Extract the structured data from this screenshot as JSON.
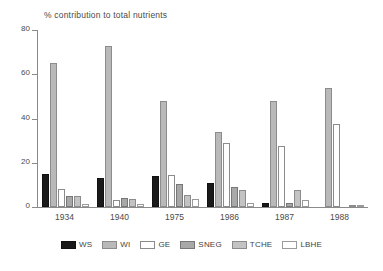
{
  "chart_data": {
    "type": "bar",
    "title": "% contribution to total nutrients",
    "xlabel": "",
    "ylabel": "",
    "ylim": [
      0,
      80
    ],
    "yticks": [
      0,
      20,
      40,
      60,
      80
    ],
    "grid": false,
    "legend_position": "bottom",
    "categories": [
      "1934",
      "1940",
      "1975",
      "1986",
      "1987",
      "1988"
    ],
    "series": [
      {
        "name": "WS",
        "key": "ws",
        "color": "#1a1a1a",
        "values": [
          15,
          13,
          14,
          11,
          2,
          0
        ]
      },
      {
        "name": "WI",
        "key": "wi",
        "color": "#b9b9b9",
        "values": [
          65,
          73,
          48,
          34,
          48,
          54
        ]
      },
      {
        "name": "GE",
        "key": "ge",
        "color": "#ffffff",
        "values": [
          8,
          3,
          14.5,
          29,
          27.5,
          37.5
        ]
      },
      {
        "name": "SNEG",
        "key": "sneg",
        "color": "#a8a8a8",
        "values": [
          5,
          4,
          10.5,
          9,
          2,
          0
        ]
      },
      {
        "name": "TCHE",
        "key": "tche",
        "color": "#c3c3c3",
        "values": [
          5,
          3.5,
          5.5,
          7.5,
          7.5,
          1
        ]
      },
      {
        "name": "LBHE",
        "key": "lbhe",
        "color": "#ffffff",
        "values": [
          1.5,
          1.5,
          3.5,
          2,
          3,
          0.5
        ]
      }
    ]
  },
  "axis": {
    "y_tick_labels": [
      "0",
      "20",
      "40",
      "60",
      "80"
    ]
  },
  "legend": {
    "items": [
      {
        "label": "WS",
        "swatch": "legend-swatch-ws"
      },
      {
        "label": "WI",
        "swatch": "legend-swatch-wi"
      },
      {
        "label": "GE",
        "swatch": "legend-swatch-ge"
      },
      {
        "label": "SNEG",
        "swatch": "legend-swatch-sneg"
      },
      {
        "label": "TCHE",
        "swatch": "legend-swatch-tche"
      },
      {
        "label": "LBHE",
        "swatch": "legend-swatch-lbhe"
      }
    ]
  }
}
